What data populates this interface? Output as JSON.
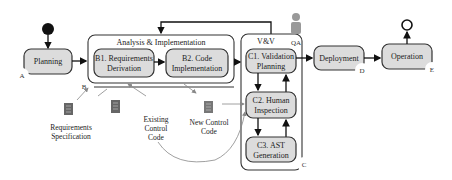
{
  "diagram": {
    "start_node": "start",
    "end_node": "end",
    "nodes": {
      "planning": "Planning",
      "b1_line1": "B1. Requirements",
      "b1_line2": "Derivation",
      "b2_line1": "B2. Code",
      "b2_line2": "Implementation",
      "c1_line1": "C1. Validation",
      "c1_line2": "Planning",
      "c2_line1": "C2. Human",
      "c2_line2": "Inspection",
      "c3_line1": "C3. AST",
      "c3_line2": "Generation",
      "deployment": "Deployment",
      "operation": "Operation"
    },
    "groups": {
      "analysis": "Analysis & Implementation",
      "vv": "V&V"
    },
    "actor": {
      "label": "QA",
      "icon": "person-icon"
    },
    "markers": {
      "a": "A",
      "b": "B",
      "c": "C",
      "d": "D",
      "e": "E"
    },
    "artifacts": {
      "req_spec_line1": "Requirements",
      "req_spec_line2": "Specification",
      "existing_line1": "Existing",
      "existing_line2": "Control",
      "existing_line3": "Code",
      "new_line1": "New Control",
      "new_line2": "Code",
      "icon": "document-icon"
    },
    "colors": {
      "node_fill": "#dcdcdc",
      "stroke": "#333333",
      "actor": "#999999"
    }
  }
}
